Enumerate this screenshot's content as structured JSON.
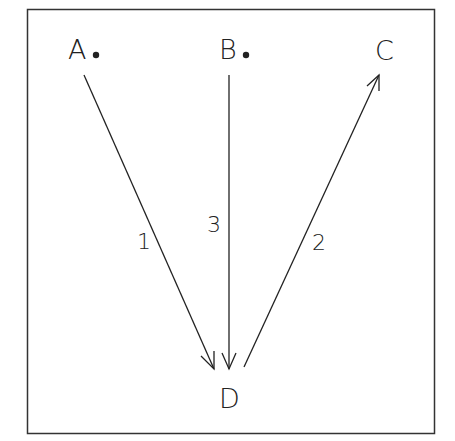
{
  "diagram": {
    "type": "vector-path-diagram",
    "frame": {
      "x": 27,
      "y": 9,
      "width": 407,
      "height": 424,
      "stroke": "#333333"
    },
    "nodes": [
      {
        "id": "A",
        "label": "A",
        "x": 78,
        "y": 59,
        "has_dot": true
      },
      {
        "id": "B",
        "label": "B",
        "x": 230,
        "y": 59,
        "has_dot": true
      },
      {
        "id": "C",
        "label": "C",
        "x": 386,
        "y": 59,
        "has_dot": false
      },
      {
        "id": "D",
        "label": "D",
        "x": 231,
        "y": 408,
        "has_dot": false
      }
    ],
    "edges": [
      {
        "id": "1",
        "label": "1",
        "from": "A",
        "to": "D",
        "arrow_at": "D"
      },
      {
        "id": "2",
        "label": "2",
        "from": "D",
        "to": "C",
        "arrow_at": "C"
      },
      {
        "id": "3",
        "label": "3",
        "from": "B",
        "to": "D",
        "arrow_at": "D"
      }
    ]
  }
}
